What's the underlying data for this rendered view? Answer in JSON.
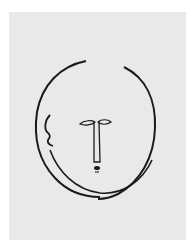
{
  "artwork": {
    "subject": "line-drawing-face",
    "colors": {
      "background": "#ffffff",
      "paper": "#e9e9e9",
      "ink": "#1a1a1a"
    }
  }
}
